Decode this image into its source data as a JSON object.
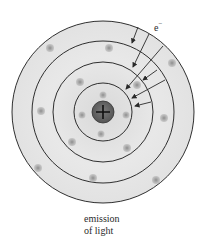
{
  "diagram": {
    "electron_label": "e",
    "electron_charge": "−",
    "nucleus_symbol": "+",
    "caption_line1": "emission",
    "caption_line2": "of light",
    "center": [
      103,
      112
    ],
    "orbit_radii": [
      29,
      50,
      71,
      91
    ],
    "nucleus_radius": 11,
    "colors": {
      "fill": "#e6e6e6",
      "orbit_stroke": "#1a1a1a",
      "nucleus_fill": "#6b6b6b",
      "electron_dot": "#9a9a9a",
      "arrow": "#2a2a2a"
    }
  }
}
